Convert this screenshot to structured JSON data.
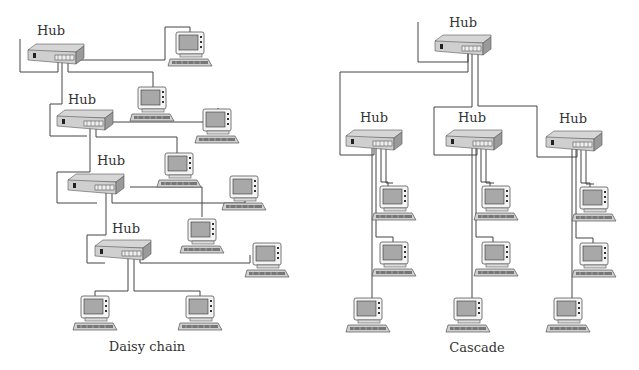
{
  "colors": {
    "wire": "#444444",
    "hub_top": "#d8d8d8",
    "hub_front": "#c4c4c4",
    "hub_side": "#9a9a9a",
    "monitor_body": "#f2f2f2",
    "screen": "#a8a8a8",
    "keyboard": "#8a8a8a",
    "outline": "#555555"
  },
  "daisy_chain": {
    "caption": "Daisy chain",
    "caption_pos": [
      147,
      351
    ],
    "hubs": [
      {
        "label": "Hub",
        "label_pos": [
          37,
          35
        ],
        "pos": [
          28,
          44
        ]
      },
      {
        "label": "Hub",
        "label_pos": [
          68,
          104
        ],
        "pos": [
          57,
          110
        ]
      },
      {
        "label": "Hub",
        "label_pos": [
          97,
          165
        ],
        "pos": [
          68,
          174
        ]
      },
      {
        "label": "Hub",
        "label_pos": [
          112,
          233
        ],
        "pos": [
          95,
          240
        ]
      }
    ],
    "computers": [
      {
        "pos": [
          168,
          32
        ]
      },
      {
        "pos": [
          130,
          87
        ]
      },
      {
        "pos": [
          195,
          109
        ]
      },
      {
        "pos": [
          157,
          153
        ]
      },
      {
        "pos": [
          222,
          176
        ]
      },
      {
        "pos": [
          180,
          219
        ]
      },
      {
        "pos": [
          245,
          243
        ]
      },
      {
        "pos": [
          73,
          296
        ]
      },
      {
        "pos": [
          178,
          296
        ]
      }
    ],
    "wires": [
      "M20,39 L20,72 L58,72 L58,57",
      "M73,60 L165,60 L165,27 L190,27 L190,34",
      "M68,57 L68,72 L153,72 L153,87",
      "M62,57 L62,104 L50,104 L50,136 L87,136",
      "M102,122 L218,122 L218,108",
      "M96,122 L96,137 L177,137 L177,153",
      "M90,122 L90,172 L57,172 L57,203 L97,203",
      "M130,187 L202,187 L202,217",
      "M112,187 L112,203 L245,203 L245,190",
      "M106,187 L106,235 L87,235 L87,263 L105,263",
      "M140,252 L140,263 L250,263 L250,255",
      "M134,252 L134,291 L200,291 L200,296",
      "M128,252 L128,291 L95,291 L95,296"
    ]
  },
  "cascade": {
    "caption": "Cascade",
    "caption_pos": [
      477,
      352
    ],
    "hubs": [
      {
        "label": "Hub",
        "label_pos": [
          449,
          27
        ],
        "pos": [
          435,
          35
        ]
      },
      {
        "label": "Hub",
        "label_pos": [
          360,
          122
        ],
        "pos": [
          346,
          130
        ]
      },
      {
        "label": "Hub",
        "label_pos": [
          458,
          122
        ],
        "pos": [
          446,
          130
        ]
      },
      {
        "label": "Hub",
        "label_pos": [
          559,
          123
        ],
        "pos": [
          546,
          131
        ]
      }
    ],
    "computers": [
      {
        "pos": [
          372,
          186
        ]
      },
      {
        "pos": [
          372,
          242
        ]
      },
      {
        "pos": [
          346,
          298
        ]
      },
      {
        "pos": [
          474,
          186
        ]
      },
      {
        "pos": [
          474,
          242
        ]
      },
      {
        "pos": [
          446,
          298
        ]
      },
      {
        "pos": [
          572,
          187
        ]
      },
      {
        "pos": [
          572,
          243
        ]
      },
      {
        "pos": [
          546,
          298
        ]
      }
    ],
    "wires": [
      "M418,22 L418,62 L468,62 L468,46",
      "M468,46 L468,72 L340,72 L340,155 L374,155 L374,142",
      "M472,46 L472,107 L434,107 L434,155 L477,155 L477,142",
      "M478,46 L478,106 L537,106 L537,157 L577,157 L577,143",
      "M372,142 L372,300",
      "M376,142 L376,237 L393,237 L393,242",
      "M381,142 L381,182 L388,182 L388,186",
      "M386,142 L386,183 L393,183",
      "M472,142 L472,300",
      "M476,142 L476,237 L493,237 L493,242",
      "M481,142 L481,182 L490,182 L490,186",
      "M486,142 L486,183 L494,183",
      "M572,143 L572,300",
      "M576,143 L576,238 L593,238 L593,243",
      "M581,143 L581,183 L590,183 L590,187",
      "M586,143 L586,184 L594,184"
    ]
  }
}
